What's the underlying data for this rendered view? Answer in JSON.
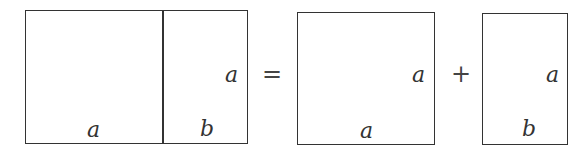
{
  "diagram": {
    "left_rect": {
      "bottom_left_label": "a",
      "bottom_right_label": "b",
      "side_label": "a"
    },
    "equals": "=",
    "square": {
      "bottom_label": "a",
      "side_label": "a"
    },
    "plus": "+",
    "small_rect": {
      "bottom_label": "b",
      "side_label": "a"
    }
  }
}
